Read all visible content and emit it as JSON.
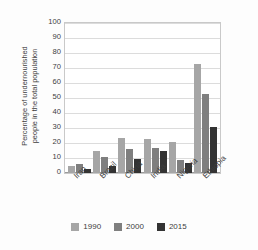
{
  "chart_data": {
    "type": "bar",
    "title": "",
    "xlabel": "",
    "ylabel_line1": "Percentage of undernourished",
    "ylabel_line2": "people in the total population",
    "ylim": [
      0,
      100
    ],
    "ytick_step": 10,
    "yticks": [
      "100",
      "90",
      "80",
      "70",
      "60",
      "50",
      "40",
      "30",
      "20",
      "10",
      "0"
    ],
    "grid": true,
    "legend_position": "bottom",
    "categories": [
      "Iran",
      "Brazil",
      "China",
      "India",
      "Nigeria",
      "Ethiopia"
    ],
    "series": [
      {
        "name": "1990",
        "color": "#a6a6a6",
        "values": [
          5,
          15,
          23.5,
          23,
          21,
          73
        ]
      },
      {
        "name": "2000",
        "color": "#7f7f7f",
        "values": [
          6,
          11,
          16,
          17,
          9,
          53
        ]
      },
      {
        "name": "2015",
        "color": "#333333",
        "values": [
          3,
          5,
          9.5,
          15,
          7,
          31
        ]
      }
    ]
  },
  "legend": {
    "items": [
      {
        "label": "1990",
        "color": "#a6a6a6"
      },
      {
        "label": "2000",
        "color": "#7f7f7f"
      },
      {
        "label": "2015",
        "color": "#333333"
      }
    ]
  },
  "colors": {
    "series_1990": "#a6a6a6",
    "series_2000": "#7f7f7f",
    "series_2015": "#333333",
    "gridline": "#dcdcdc",
    "plot_border": "#c9c9c9",
    "text": "#3d3d3d",
    "background": "#fdfdfd"
  }
}
